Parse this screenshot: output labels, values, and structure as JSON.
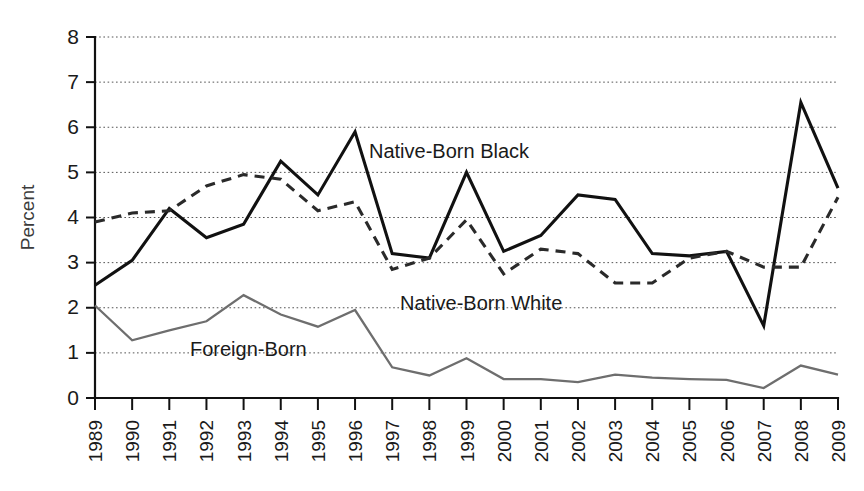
{
  "chart_data": {
    "type": "line",
    "title": "",
    "xlabel": "",
    "ylabel": "Percent",
    "ylim": [
      0,
      8
    ],
    "yticks": [
      0,
      1,
      2,
      3,
      4,
      5,
      6,
      7,
      8
    ],
    "grid": true,
    "legend_position": "inline-annotations",
    "categories": [
      "1989",
      "1990",
      "1991",
      "1992",
      "1993",
      "1994",
      "1995",
      "1996",
      "1997",
      "1998",
      "1999",
      "2000",
      "2001",
      "2002",
      "2003",
      "2004",
      "2005",
      "2006",
      "2007",
      "2008",
      "2009"
    ],
    "series": [
      {
        "name": "Native-Born Black",
        "style": "solid",
        "color": "#111111",
        "values": [
          2.5,
          3.05,
          4.2,
          3.55,
          3.85,
          5.25,
          4.5,
          5.9,
          3.2,
          3.1,
          5.0,
          3.25,
          3.6,
          4.5,
          4.4,
          3.2,
          3.15,
          3.25,
          1.6,
          6.55,
          4.65
        ]
      },
      {
        "name": "Native-Born White",
        "style": "dashed",
        "color": "#2a2a2a",
        "values": [
          3.9,
          4.1,
          4.15,
          4.7,
          4.95,
          4.85,
          4.15,
          4.35,
          2.85,
          3.1,
          3.95,
          2.75,
          3.3,
          3.2,
          2.55,
          2.55,
          3.1,
          3.25,
          2.9,
          2.9,
          4.45
        ]
      },
      {
        "name": "Foreign-Born",
        "style": "solid-thin",
        "color": "#6e6e6e",
        "values": [
          2.05,
          1.28,
          1.5,
          1.7,
          2.28,
          1.85,
          1.58,
          1.95,
          0.68,
          0.5,
          0.88,
          0.42,
          0.42,
          0.35,
          0.52,
          0.45,
          0.42,
          0.4,
          0.22,
          0.72,
          0.52
        ]
      }
    ],
    "annotations": [
      {
        "text": "Native-Born Black",
        "x_px": 369,
        "y_px": 158
      },
      {
        "text": "Native-Born White",
        "x_px": 400,
        "y_px": 310
      },
      {
        "text": "Foreign-Born",
        "x_px": 190,
        "y_px": 356
      }
    ]
  }
}
